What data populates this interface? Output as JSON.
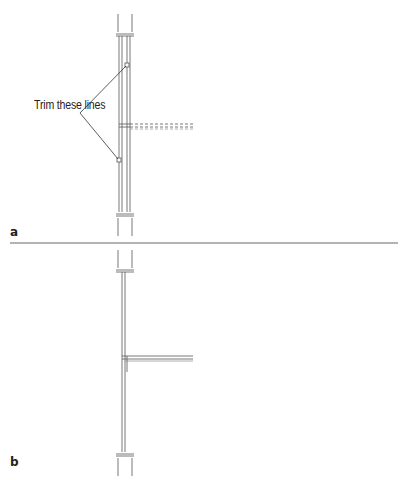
{
  "figure": {
    "callout_text": "Trim these lines",
    "panels": [
      {
        "label": "a",
        "description": "Before trim: vertical wall with dashed intersecting wall and two trim markers"
      },
      {
        "label": "b",
        "description": "After trim: vertical wall with solid intersecting wall"
      }
    ]
  },
  "colors": {
    "line": "#555555",
    "divider": "#9a9a9a",
    "text": "#222222"
  }
}
